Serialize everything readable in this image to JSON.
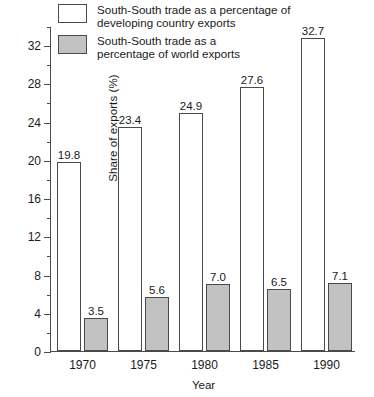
{
  "chart_data": {
    "type": "bar",
    "title": "",
    "xlabel": "Year",
    "ylabel": "Share of exports (%)",
    "categories": [
      "1970",
      "1975",
      "1980",
      "1985",
      "1990"
    ],
    "series": [
      {
        "name": "South-South trade as a percentage of\ndeveloping country exports",
        "color": "#ffffff",
        "values": [
          19.8,
          23.4,
          24.9,
          27.6,
          32.7
        ],
        "labels": [
          "19.8",
          "23.4",
          "24.9",
          "27.6",
          "32.7"
        ]
      },
      {
        "name": "South-South trade as a\npercentage of world exports",
        "color": "#c2c2c2",
        "values": [
          3.5,
          5.6,
          7.0,
          6.5,
          7.1
        ],
        "labels": [
          "3.5",
          "5.6",
          "7.0",
          "6.5",
          "7.1"
        ]
      }
    ],
    "ylim": [
      0,
      34
    ],
    "y_major_ticks": [
      0,
      4,
      8,
      12,
      16,
      20,
      24,
      28,
      32
    ],
    "y_major_tick_labels": [
      "0",
      "4",
      "8",
      "12",
      "16",
      "20",
      "24",
      "28",
      "32"
    ],
    "y_minor_ticks": [
      2,
      6,
      10,
      14,
      18,
      22,
      26,
      30,
      34
    ],
    "grid": false,
    "legend_position": "top-left",
    "axis_color": "#4a4a4a",
    "bar_edge_color": "#4a4a4a"
  }
}
